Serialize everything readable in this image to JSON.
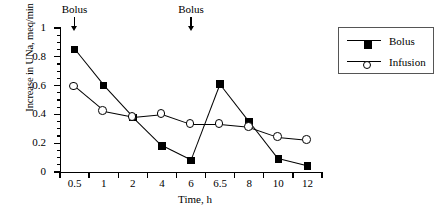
{
  "chart_data": {
    "type": "line",
    "title": "",
    "xlabel": "Time, h",
    "ylabel": "Increase in UNa, meq/min",
    "categories": [
      "0.5",
      "1",
      "2",
      "4",
      "6",
      "6.5",
      "8",
      "10",
      "12"
    ],
    "ylim": [
      0,
      1
    ],
    "ytick_labels": [
      "0",
      "0.2",
      "0.4",
      "0.6",
      "0.8",
      "1"
    ],
    "ytick_values": [
      0,
      0.2,
      0.4,
      0.6,
      0.8,
      1
    ],
    "yminor_step": 0.05,
    "grid": false,
    "legend_position": "top-right",
    "series": [
      {
        "name": "Bolus",
        "marker": "filled-square",
        "values": [
          0.85,
          0.6,
          0.38,
          0.18,
          0.08,
          0.61,
          0.35,
          0.09,
          0.04
        ]
      },
      {
        "name": "Infusion",
        "marker": "open-circle",
        "values": [
          0.59,
          0.42,
          0.38,
          0.4,
          0.33,
          0.33,
          0.31,
          0.24,
          0.22
        ]
      }
    ],
    "annotations": [
      {
        "text": "Bolus",
        "at_category": "0.5",
        "arrow": "down"
      },
      {
        "text": "Bolus",
        "at_category": "6",
        "arrow": "down"
      }
    ]
  },
  "legend": {
    "entries": [
      {
        "label": "Bolus"
      },
      {
        "label": "Infusion"
      }
    ]
  },
  "colors": {
    "foreground": "#000000",
    "background": "#ffffff",
    "legend_border": "#555555"
  }
}
